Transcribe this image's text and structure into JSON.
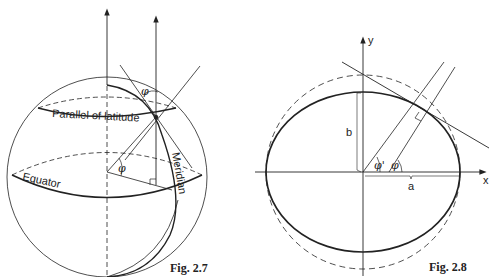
{
  "figures": [
    {
      "id": "fig-2-7",
      "caption": "Fig. 2.7",
      "labels": {
        "parallel": "Parallel of latitude",
        "equator": "Equator",
        "meridian": "Meridian",
        "phi_top": "φ",
        "phi_center": "φ"
      }
    },
    {
      "id": "fig-2-8",
      "caption": "Fig. 2.8",
      "labels": {
        "y_axis": "y",
        "x_axis": "x",
        "semi_minor": "b",
        "semi_major": "a",
        "phi_prime": "φ'",
        "phi": "φ"
      }
    }
  ]
}
